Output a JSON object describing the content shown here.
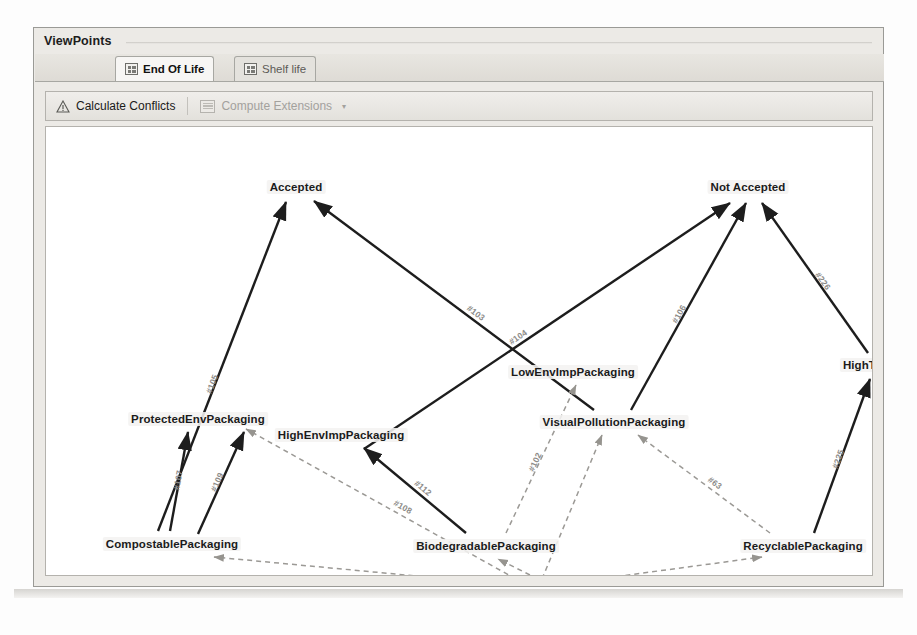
{
  "window": {
    "title": "ViewPoints"
  },
  "tabs": [
    {
      "label": "End Of Life",
      "icon": "grid-icon",
      "active": true
    },
    {
      "label": "Shelf life",
      "icon": "grid-icon",
      "active": false
    }
  ],
  "toolbar": {
    "calculate_conflicts_label": "Calculate Conflicts",
    "calculate_conflicts_icon": "warning-triangle-icon",
    "compute_extensions_label": "Compute Extensions",
    "compute_extensions_icon": "table-icon",
    "compute_extensions_caret": "▾",
    "compute_extensions_enabled": false
  },
  "graph": {
    "nodes": [
      {
        "id": "accepted",
        "label": "Accepted",
        "x": 250,
        "y": 60
      },
      {
        "id": "notaccepted",
        "label": "Not Accepted",
        "x": 702,
        "y": 60
      },
      {
        "id": "lowenv",
        "label": "LowEnvImpPackaging",
        "x": 527,
        "y": 245
      },
      {
        "id": "hightaxes",
        "label": "HighTaxes",
        "x": 826,
        "y": 238
      },
      {
        "id": "protectedenv",
        "label": "ProtectedEnvPackaging",
        "x": 152,
        "y": 292
      },
      {
        "id": "highenv",
        "label": "HighEnvImpPackaging",
        "x": 295,
        "y": 308
      },
      {
        "id": "visualpollution",
        "label": "VisualPollutionPackaging",
        "x": 568,
        "y": 295
      },
      {
        "id": "compostable",
        "label": "CompostablePackaging",
        "x": 126,
        "y": 417
      },
      {
        "id": "biodegradable",
        "label": "BiodegradablePackaging",
        "x": 440,
        "y": 419
      },
      {
        "id": "recyclable",
        "label": "RecyclablePackaging",
        "x": 757,
        "y": 419
      },
      {
        "id": "choices",
        "label": "CHOICES",
        "x": 486,
        "y": 462
      }
    ],
    "edges": [
      {
        "id": "105",
        "label": "#105",
        "from": "compostable",
        "to": "accepted",
        "style": "solid",
        "x1": 112,
        "y1": 404,
        "x2": 240,
        "y2": 75
      },
      {
        "id": "103",
        "label": "#103",
        "from": "visualpollution",
        "to": "accepted",
        "style": "solid",
        "x1": 548,
        "y1": 283,
        "x2": 268,
        "y2": 74
      },
      {
        "id": "104",
        "label": "#104",
        "from": "highenv",
        "to": "notaccepted",
        "style": "solid",
        "x1": 318,
        "y1": 322,
        "x2": 684,
        "y2": 76
      },
      {
        "id": "106",
        "label": "#106",
        "from": "visualpollution",
        "to": "notaccepted",
        "style": "solid",
        "x1": 585,
        "y1": 283,
        "x2": 700,
        "y2": 76
      },
      {
        "id": "226",
        "label": "#226",
        "from": "hightaxes",
        "to": "notaccepted",
        "style": "solid",
        "x1": 822,
        "y1": 226,
        "x2": 716,
        "y2": 76
      },
      {
        "id": "225",
        "label": "#225",
        "from": "recyclable",
        "to": "hightaxes",
        "style": "solid",
        "x1": 768,
        "y1": 406,
        "x2": 824,
        "y2": 252
      },
      {
        "id": "107",
        "label": "#107",
        "from": "compostable",
        "to": "protectedenv",
        "style": "solid",
        "x1": 124,
        "y1": 404,
        "x2": 142,
        "y2": 305
      },
      {
        "id": "109",
        "label": "#109",
        "from": "compostable",
        "to": "protectedenv",
        "style": "solid",
        "x1": 152,
        "y1": 407,
        "x2": 198,
        "y2": 305
      },
      {
        "id": "112",
        "label": "#112",
        "from": "biodegradable",
        "to": "highenv",
        "style": "solid",
        "x1": 420,
        "y1": 406,
        "x2": 318,
        "y2": 321
      },
      {
        "id": "108",
        "label": "#108",
        "from": "choices",
        "to": "protectedenv",
        "style": "dashed",
        "x1": 470,
        "y1": 452,
        "x2": 200,
        "y2": 302
      },
      {
        "id": "63",
        "label": "#63",
        "from": "choices",
        "to": "visualpollution",
        "style": "dashed",
        "x1": 724,
        "y1": 406,
        "x2": 592,
        "y2": 308
      },
      {
        "id": "102",
        "label": "#102",
        "from": "biodegradable",
        "to": "lowenv",
        "style": "dashed",
        "x1": 460,
        "y1": 406,
        "x2": 530,
        "y2": 258
      },
      {
        "id": "c1",
        "label": "",
        "from": "choices",
        "to": "compostable",
        "style": "dashed",
        "x1": 466,
        "y1": 458,
        "x2": 168,
        "y2": 430
      },
      {
        "id": "c2",
        "label": "",
        "from": "choices",
        "to": "biodegradable",
        "style": "dashed",
        "x1": 492,
        "y1": 452,
        "x2": 452,
        "y2": 432
      },
      {
        "id": "c3",
        "label": "",
        "from": "choices",
        "to": "recyclable",
        "style": "dashed",
        "x1": 508,
        "y1": 458,
        "x2": 716,
        "y2": 430
      },
      {
        "id": "c4",
        "label": "",
        "from": "choices",
        "to": "visualpollution",
        "style": "dashed",
        "x1": 496,
        "y1": 452,
        "x2": 556,
        "y2": 308
      }
    ]
  }
}
